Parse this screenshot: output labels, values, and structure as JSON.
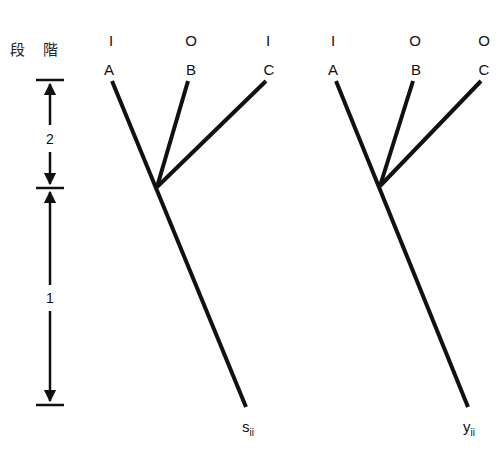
{
  "stage_axis": {
    "title_chars": [
      "段",
      "階"
    ],
    "stages": [
      {
        "label": "2",
        "top_y": 80,
        "bottom_y": 188
      },
      {
        "label": "1",
        "top_y": 188,
        "bottom_y": 405
      }
    ]
  },
  "trees": [
    {
      "id": "tree-s",
      "root_label": "s",
      "root_subscript": "ii",
      "leaves": [
        {
          "name": "A",
          "state": "I"
        },
        {
          "name": "B",
          "state": "O"
        },
        {
          "name": "C",
          "state": "I"
        }
      ]
    },
    {
      "id": "tree-y",
      "root_label": "y",
      "root_subscript": "ii",
      "leaves": [
        {
          "name": "A",
          "state": "I"
        },
        {
          "name": "B",
          "state": "O"
        },
        {
          "name": "C",
          "state": "O"
        }
      ]
    }
  ],
  "colors": {
    "line": "#111111",
    "background": "#ffffff"
  }
}
